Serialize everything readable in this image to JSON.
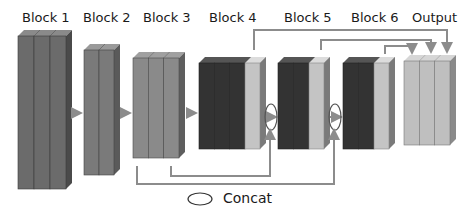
{
  "labels": {
    "block1": "Block 1",
    "block2": "Block 2",
    "block3": "Block 3",
    "block4": "Block 4",
    "block5": "Block 5",
    "block6": "Block 6",
    "output": "Output"
  },
  "legend": {
    "concat_label": "Concat"
  },
  "colors": {
    "block1": "#6b6b6b",
    "block2": "#7a7a7a",
    "block3": "#8a8a8a",
    "dark": "#333333",
    "light": "#c4c4c4",
    "output": "#bfbfbf",
    "connector": "#8c8c8c"
  },
  "blocks": [
    {
      "name": "Block 1",
      "columns": [
        "mid",
        "mid",
        "mid"
      ]
    },
    {
      "name": "Block 2",
      "columns": [
        "mid",
        "mid"
      ]
    },
    {
      "name": "Block 3",
      "columns": [
        "mid",
        "mid",
        "mid"
      ]
    },
    {
      "name": "Block 4",
      "columns": [
        "dark",
        "dark",
        "dark",
        "light"
      ]
    },
    {
      "name": "Block 5",
      "columns": [
        "dark",
        "dark",
        "light"
      ]
    },
    {
      "name": "Block 6",
      "columns": [
        "dark",
        "dark",
        "light"
      ]
    },
    {
      "name": "Output",
      "columns": [
        "light",
        "light",
        "light"
      ]
    }
  ]
}
